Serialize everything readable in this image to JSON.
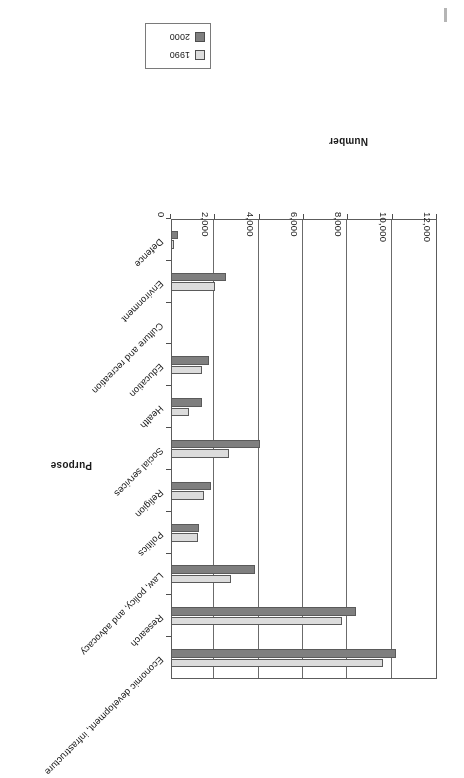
{
  "chart_data": {
    "type": "bar",
    "orientation": "horizontal",
    "title": "",
    "xlabel": "Number",
    "ylabel": "Purpose",
    "xlim": [
      0,
      12000
    ],
    "grid": true,
    "legend_position": "top",
    "tick_labels": [
      "0",
      "2,000",
      "4,000",
      "6,000",
      "8,000",
      "10,000",
      "12,000"
    ],
    "tick_values": [
      0,
      2000,
      4000,
      6000,
      8000,
      10000,
      12000
    ],
    "categories": [
      "Economic development, infrastructure",
      "Research",
      "Law, policy, and advocacy",
      "Politics",
      "Religion",
      "Social services",
      "Health",
      "Education",
      "Culture and recreation",
      "Environment",
      "Defence"
    ],
    "series": [
      {
        "name": "1990",
        "color": "#dcdcdc",
        "values": [
          9550,
          7700,
          2700,
          1200,
          1500,
          2600,
          800,
          1400,
          0,
          2000,
          150
        ]
      },
      {
        "name": "2000",
        "color": "#7f7f7f",
        "values": [
          10150,
          8350,
          3800,
          1250,
          1800,
          4000,
          1400,
          1700,
          0,
          2500,
          300
        ]
      }
    ]
  },
  "legend": {
    "items": [
      {
        "label": "1990",
        "color": "#dcdcdc"
      },
      {
        "label": "2000",
        "color": "#7f7f7f"
      }
    ]
  },
  "axes": {
    "value_axis_title": "Number",
    "category_axis_title": "Purpose"
  }
}
